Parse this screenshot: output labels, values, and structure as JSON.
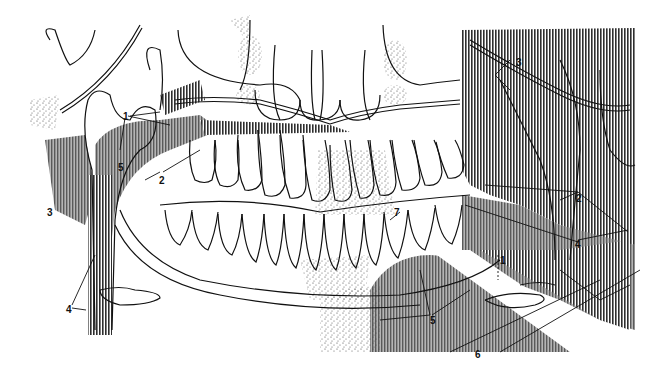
{
  "diagram": {
    "type": "anatomical line drawing",
    "colors": {
      "ink": "#111111",
      "hatch": "#3a3a3a",
      "gray": "#9a9a9a",
      "stipple": "#555555",
      "paper": "#ffffff"
    },
    "labels": [
      {
        "id": "l1a",
        "text": "1",
        "x": 123,
        "y": 112
      },
      {
        "id": "l2a",
        "text": "2",
        "x": 159,
        "y": 176
      },
      {
        "id": "l3a",
        "text": "3",
        "x": 47,
        "y": 214
      },
      {
        "id": "l4a",
        "text": "4",
        "x": 68,
        "y": 309
      },
      {
        "id": "l5a",
        "text": "5",
        "x": 118,
        "y": 163
      },
      {
        "id": "l7",
        "text": "7",
        "x": 394,
        "y": 214
      },
      {
        "id": "l3b",
        "text": "3",
        "x": 516,
        "y": 60
      },
      {
        "id": "l2b",
        "text": "2",
        "x": 576,
        "y": 195
      },
      {
        "id": "l4b",
        "text": "4",
        "x": 575,
        "y": 241
      },
      {
        "id": "l1b",
        "text": "1",
        "x": 500,
        "y": 257
      },
      {
        "id": "l5b",
        "text": "5",
        "x": 430,
        "y": 318
      },
      {
        "id": "l6",
        "text": "6",
        "x": 475,
        "y": 352
      }
    ]
  }
}
